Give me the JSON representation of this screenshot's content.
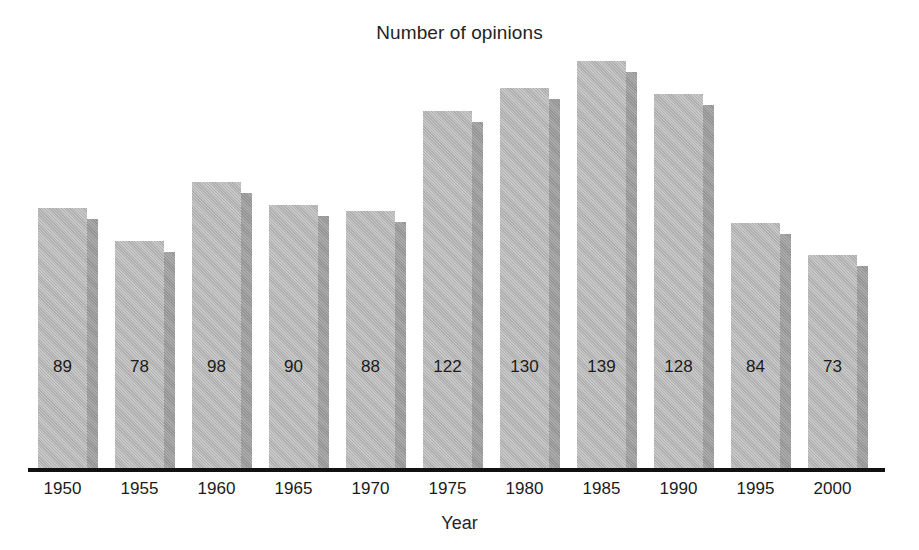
{
  "chart_data": {
    "type": "bar",
    "title": "Number of opinions",
    "xlabel": "Year",
    "ylabel": "",
    "categories": [
      "1950",
      "1955",
      "1960",
      "1965",
      "1970",
      "1975",
      "1980",
      "1985",
      "1990",
      "1995",
      "2000"
    ],
    "values": [
      89,
      78,
      98,
      90,
      88,
      122,
      130,
      139,
      128,
      84,
      73
    ],
    "value_labels": [
      "89",
      "78",
      "98",
      "90",
      "88",
      "122",
      "130",
      "139",
      "128",
      "84",
      "73"
    ],
    "ylim": [
      0,
      160
    ],
    "grid": false,
    "legend": null,
    "axis_style": "baseline-only",
    "bar_style": "3d-extruded-gray",
    "colors": {
      "bar_front": "#b6b6b6",
      "bar_side": "#9c9c9c",
      "axis": "#111111",
      "text": "#1b1b1b",
      "background": "#ffffff"
    }
  },
  "chart": {
    "title": "Number of opinions",
    "x_axis_title": "Year"
  }
}
